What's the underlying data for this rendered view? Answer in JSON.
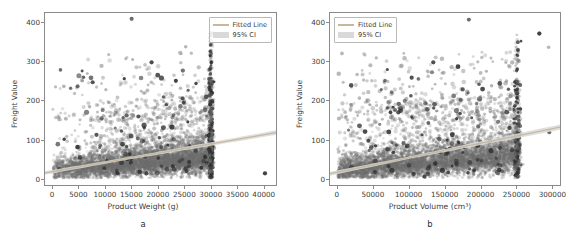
{
  "figure": {
    "background": "#ffffff",
    "point_color": "#6e6e6e",
    "line_color": "#c8b79a",
    "ci_color": "#d9d9d9"
  },
  "panels": [
    {
      "caption": "a",
      "legend_position": "upper right",
      "legend": [
        {
          "label": "Fitted Line",
          "swatch": "line"
        },
        {
          "label": "95% CI",
          "swatch": "band"
        }
      ],
      "xlabel": "Product Weight (g)",
      "ylabel": "Freight Value",
      "xticks": [
        "0",
        "5000",
        "10000",
        "15000",
        "20000",
        "25000",
        "30000",
        "35000",
        "40000"
      ],
      "yticks": [
        "0",
        "100",
        "200",
        "300",
        "400"
      ]
    },
    {
      "caption": "b",
      "legend_position": "upper left",
      "legend": [
        {
          "label": "Fitted Line",
          "swatch": "line"
        },
        {
          "label": "95% CI",
          "swatch": "band"
        }
      ],
      "xlabel": "Product Volume (cm³)",
      "ylabel": "Freight Value",
      "xticks": [
        "0",
        "50000",
        "100000",
        "150000",
        "200000",
        "250000",
        "300000"
      ],
      "yticks": [
        "0",
        "100",
        "200",
        "300",
        "400"
      ]
    }
  ],
  "chart_data": [
    {
      "type": "scatter",
      "panel": "a",
      "title": "",
      "xlabel": "Product Weight (g)",
      "ylabel": "Freight Value",
      "xlim": [
        -1500,
        42500
      ],
      "ylim": [
        -18,
        425
      ],
      "xticks": [
        0,
        5000,
        10000,
        15000,
        20000,
        25000,
        30000,
        35000,
        40000
      ],
      "yticks": [
        0,
        100,
        200,
        300,
        400
      ],
      "grid": false,
      "legend_position": "upper right",
      "series": [
        {
          "name": "Observations",
          "marker": "circle",
          "color": "#6e6e6e",
          "alpha": 0.35,
          "description": "Dense cloud of freight values concentrated between 0 and 100 for product weights 0-30000 g, with a pronounced vertical cluster at 30000 g and sparse high-value outliers up to 410.",
          "n_points_approx": 3000
        },
        {
          "name": "Fitted Line",
          "type": "line",
          "color": "#c8b79a",
          "endpoints": [
            [
              -1500,
              13
            ],
            [
              42500,
              117
            ]
          ],
          "slope_per_unit": 0.00236,
          "intercept": 16.5
        },
        {
          "name": "95% CI",
          "type": "band",
          "color": "#d9d9d9",
          "half_width_at_xmin": 3.0,
          "half_width_at_xmax": 6.0
        }
      ],
      "annotations": [
        {
          "text": "vertical cluster",
          "x": 30000,
          "y_range": [
            0,
            375
          ]
        },
        {
          "text": "max outlier",
          "x": 15000,
          "y": 410
        },
        {
          "text": "far-right outlier",
          "x": 40400,
          "y": 12
        }
      ]
    },
    {
      "type": "scatter",
      "panel": "b",
      "title": "",
      "xlabel": "Product Volume (cm³)",
      "ylabel": "Freight Value",
      "xlim": [
        -11000,
        312000
      ],
      "ylim": [
        -18,
        425
      ],
      "xticks": [
        0,
        50000,
        100000,
        150000,
        200000,
        250000,
        300000
      ],
      "yticks": [
        0,
        100,
        200,
        300,
        400
      ],
      "grid": false,
      "legend_position": "upper left",
      "series": [
        {
          "name": "Observations",
          "marker": "circle",
          "color": "#6e6e6e",
          "alpha": 0.35,
          "description": "Dense cloud of freight values concentrated between 0 and 110 for product volumes 0-160000 cm³, diffusing to the right with a vertical cluster near 250000 cm³ and outliers up to 410.",
          "n_points_approx": 3000
        },
        {
          "name": "Fitted Line",
          "type": "line",
          "color": "#c8b79a",
          "endpoints": [
            [
              -11000,
              11
            ],
            [
              312000,
              131
            ]
          ],
          "slope_per_unit": 0.00037,
          "intercept": 15.0
        },
        {
          "name": "95% CI",
          "type": "band",
          "color": "#d9d9d9",
          "half_width_at_xmin": 3.0,
          "half_width_at_xmax": 7.0
        }
      ],
      "annotations": [
        {
          "text": "vertical cluster",
          "x": 252000,
          "y_range": [
            10,
            340
          ]
        },
        {
          "text": "max outlier",
          "x": 184000,
          "y": 408
        },
        {
          "text": "high-volume outlier",
          "x": 283000,
          "y": 372
        }
      ]
    }
  ]
}
